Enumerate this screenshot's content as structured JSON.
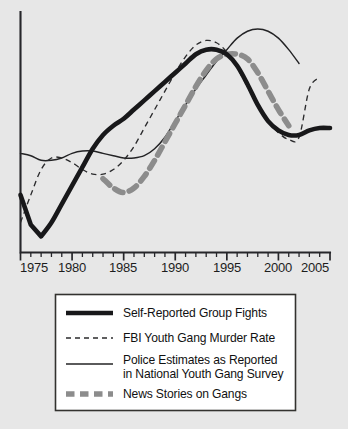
{
  "chart_data": {
    "type": "line",
    "title": "",
    "subtitle": "",
    "xlabel": "",
    "ylabel": "",
    "xlim": [
      1975,
      2005
    ],
    "ylim": [
      0,
      100
    ],
    "grid": false,
    "legend_position": "bottom",
    "x_tick_labels": [
      "1975",
      "1980",
      "1985",
      "1990",
      "1995",
      "2000",
      "2005"
    ],
    "x_tick_values": [
      1975,
      1980,
      1985,
      1990,
      1995,
      2000,
      2005
    ],
    "x_minor_tick_interval": 1,
    "y_axis_labeled": false,
    "y_tick_labels": [],
    "series": [
      {
        "name": "Self-Reported Group Fights",
        "style": "thick-solid",
        "color": "#18181a",
        "x": [
          1975,
          1976,
          1977,
          1978,
          1979,
          1980,
          1981,
          1982,
          1983,
          1984,
          1985,
          1986,
          1987,
          1988,
          1989,
          1990,
          1991,
          1992,
          1993,
          1994,
          1995,
          1996,
          1997,
          1998,
          1999,
          2000,
          2001,
          2002,
          2003,
          2004,
          2005
        ],
        "values": [
          25,
          12,
          7,
          13,
          21,
          29,
          37,
          45,
          51,
          55,
          58,
          62,
          66,
          70,
          74,
          78,
          82,
          86,
          88,
          88,
          86,
          81,
          73,
          64,
          57,
          53,
          51,
          51,
          53,
          54,
          54
        ]
      },
      {
        "name": "FBI Youth Gang Murder Rate",
        "style": "thin-dashed",
        "color": "#2b2b2d",
        "x": [
          1975,
          1976,
          1977,
          1978,
          1979,
          1980,
          1981,
          1982,
          1983,
          1984,
          1985,
          1986,
          1987,
          1988,
          1989,
          1990,
          1991,
          1992,
          1993,
          1994,
          1995,
          1996,
          1997,
          1998,
          1999,
          2000,
          2001,
          2002,
          2003,
          2004
        ],
        "values": [
          13,
          25,
          36,
          41,
          41,
          39,
          36,
          34,
          34,
          36,
          40,
          46,
          54,
          62,
          70,
          78,
          85,
          90,
          92,
          91,
          87,
          80,
          72,
          64,
          57,
          52,
          49,
          50,
          71,
          76
        ]
      },
      {
        "name": "Police Estimates as Reported in National Youth Gang Survey",
        "style": "thin-solid",
        "color": "#232325",
        "x": [
          1975,
          1976,
          1977,
          1978,
          1979,
          1980,
          1981,
          1982,
          1983,
          1984,
          1985,
          1986,
          1987,
          1988,
          1989,
          1990,
          1991,
          1992,
          1993,
          1994,
          1995,
          1996,
          1997,
          1998,
          1999,
          2000,
          2001,
          2002
        ],
        "values": [
          43,
          42,
          40,
          40,
          41,
          43,
          44,
          44,
          43,
          42,
          41,
          41,
          42,
          45,
          50,
          57,
          64,
          71,
          77,
          83,
          88,
          93,
          96,
          97,
          96,
          93,
          88,
          82
        ]
      },
      {
        "name": "News Stories on Gangs",
        "style": "thick-dashed",
        "color": "#8c8c8c",
        "x": [
          1983,
          1984,
          1985,
          1986,
          1987,
          1988,
          1989,
          1990,
          1991,
          1992,
          1993,
          1994,
          1995,
          1996,
          1997,
          1998,
          1999,
          2000,
          2001
        ],
        "values": [
          32,
          28,
          26,
          28,
          33,
          40,
          48,
          56,
          64,
          72,
          79,
          84,
          86,
          86,
          84,
          78,
          70,
          62,
          55
        ]
      }
    ]
  },
  "legend": {
    "entries": [
      {
        "key": "self-reported-group-fights",
        "label": "Self-Reported Group Fights",
        "line2": ""
      },
      {
        "key": "fbi-youth-gang-murder-rate",
        "label": "FBI Youth Gang Murder Rate",
        "line2": ""
      },
      {
        "key": "police-estimates",
        "label": "Police Estimates as Reported",
        "line2": "in National Youth Gang Survey"
      },
      {
        "key": "news-stories-on-gangs",
        "label": "News Stories on Gangs",
        "line2": ""
      }
    ]
  },
  "axis": {
    "x_labels": [
      "1975",
      "1980",
      "1985",
      "1990",
      "1995",
      "2000",
      "2005"
    ]
  },
  "colors": {
    "background": "#e7e7e7",
    "axis": "#26262a",
    "self_reported": "#18181a",
    "fbi": "#2b2b2d",
    "police": "#232325",
    "news": "#8c8c8c",
    "legend_fill": "#ffffff",
    "legend_border": "#33322f"
  }
}
